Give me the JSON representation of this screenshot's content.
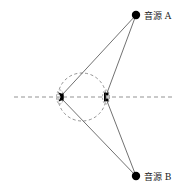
{
  "diagram": {
    "title": "",
    "sources": [
      {
        "id": "A",
        "label": "音源 A",
        "x": 136,
        "y": 15
      },
      {
        "id": "B",
        "label": "音源 B",
        "x": 136,
        "y": 176
      }
    ],
    "head": {
      "cx": 82,
      "cy": 97,
      "r": 24
    },
    "ears": [
      {
        "id": "left",
        "x": 61,
        "y": 97
      },
      {
        "id": "right",
        "x": 106,
        "y": 97
      }
    ],
    "axis": {
      "y": 97,
      "x1": 14,
      "x2": 172
    },
    "colors": {
      "line": "#333333",
      "dashed": "#666666",
      "fill": "#000000"
    }
  }
}
